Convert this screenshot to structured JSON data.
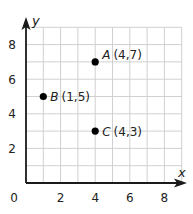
{
  "diagram": {
    "type": "coordinate-plane",
    "x_axis": {
      "label": "x",
      "ticks": [
        "2",
        "4",
        "6",
        "8"
      ],
      "origin_label": "0",
      "range": [
        0,
        9
      ]
    },
    "y_axis": {
      "label": "y",
      "ticks": [
        "2",
        "4",
        "6",
        "8"
      ],
      "range": [
        0,
        9
      ]
    },
    "grid": {
      "step": 1,
      "color": "#d0d0d0"
    },
    "points": [
      {
        "name": "A",
        "coords": "(4,7)",
        "x": 4,
        "y": 7
      },
      {
        "name": "B",
        "coords": "(1,5)",
        "x": 1,
        "y": 5
      },
      {
        "name": "C",
        "coords": "(4,3)",
        "x": 4,
        "y": 3
      }
    ],
    "colors": {
      "axis": "#1a1a1a",
      "point": "#000000",
      "grid": "#d0d0d0"
    }
  }
}
